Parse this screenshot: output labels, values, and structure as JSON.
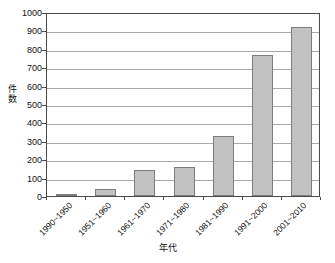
{
  "chart_data": {
    "type": "bar",
    "title": "",
    "subtitle": "",
    "xlabel": "年代",
    "ylabel": "件数",
    "categories": [
      "1990~1950",
      "1951~1960",
      "1961~1970",
      "1971~1980",
      "1981~1990",
      "1991~2000",
      "2001~2010"
    ],
    "values": [
      8,
      38,
      140,
      157,
      326,
      766,
      920
    ],
    "ylim": [
      0,
      1000
    ],
    "ytick_step": 100,
    "yticks": [
      "1000",
      "900",
      "800",
      "700",
      "600",
      "500",
      "400",
      "300",
      "200",
      "100",
      "0"
    ],
    "ytick_values": [
      1000,
      900,
      800,
      700,
      600,
      500,
      400,
      300,
      200,
      100,
      0
    ],
    "grid": true,
    "grid_axis": "y",
    "legend": false,
    "legend_position": "none",
    "annotations": [],
    "colors": {
      "bar_fill": "#c2c2c2",
      "bar_border": "#7d7d7d",
      "gridline": "#a9a9a9",
      "axis": "#4a4a4a",
      "text": "#111111",
      "background": "#ffffff"
    }
  }
}
